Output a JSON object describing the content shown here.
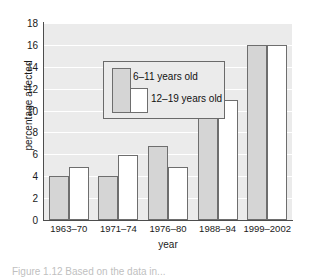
{
  "chart_data": {
    "type": "bar",
    "title": "",
    "xlabel": "year",
    "ylabel": "percentage affected",
    "categories": [
      "1963–70",
      "1971–74",
      "1976–80",
      "1988–94",
      "1999–2002"
    ],
    "series": [
      {
        "name": "6–11 years old",
        "values": [
          4,
          4,
          6.8,
          11,
          16
        ],
        "color": "#d5d5d5"
      },
      {
        "name": "12–19 years old",
        "values": [
          4.8,
          5.9,
          4.8,
          11,
          16
        ],
        "color": "#ffffff"
      }
    ],
    "ylim": [
      0,
      18
    ],
    "yticks": [
      0,
      2,
      4,
      6,
      8,
      10,
      12,
      14,
      16,
      18
    ],
    "ytick_labels": [
      "0",
      "2",
      "4",
      "6",
      "8",
      "10",
      "12",
      "14",
      "16",
      "18"
    ],
    "grid": true,
    "grid_color": "#ffffff",
    "plot_background": "#ebebeb",
    "bar_edge_color": "#6e6e6e",
    "axis_color": "#4d4d4d",
    "legend_position": "upper-left",
    "legend_entries": [
      "6–11 years old",
      "12–19 years old"
    ]
  },
  "caption": {
    "text": "Figure 1.12   Based on the data in..."
  }
}
